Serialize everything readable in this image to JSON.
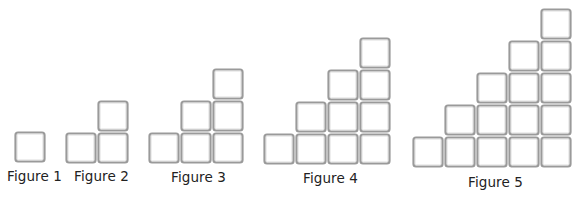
{
  "diagram": {
    "type": "toothpick-staircase-pattern",
    "square_style": {
      "stroke_outer": "#9a9a9a",
      "stroke_inner": "#d4d4d4",
      "fill": "#ffffff",
      "cell_size": 32
    },
    "figures": [
      {
        "label": "Figure 1",
        "n": 1,
        "origin_x": 14,
        "base_y": 163,
        "label_x": 7,
        "label_y": 170
      },
      {
        "label": "Figure 2",
        "n": 2,
        "origin_x": 65,
        "base_y": 164,
        "label_x": 74,
        "label_y": 170
      },
      {
        "label": "Figure 3",
        "n": 3,
        "origin_x": 148,
        "base_y": 164,
        "label_x": 171,
        "label_y": 171
      },
      {
        "label": "Figure 4",
        "n": 4,
        "origin_x": 263,
        "base_y": 165,
        "label_x": 303,
        "label_y": 172
      },
      {
        "label": "Figure 5",
        "n": 5,
        "origin_x": 412,
        "base_y": 168,
        "label_x": 468,
        "label_y": 176
      }
    ]
  }
}
